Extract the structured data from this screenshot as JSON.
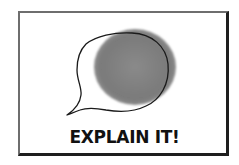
{
  "card": {
    "caption": "EXPLAIN IT!",
    "icon": "speech-bubble-icon"
  },
  "colors": {
    "frame_dark": "#1e1e1e",
    "frame_light": "#6e6e6e",
    "circle_fill": "#7d7d7d",
    "outline": "#1a1a1a",
    "caption_text": "#111111",
    "background": "#ffffff"
  }
}
